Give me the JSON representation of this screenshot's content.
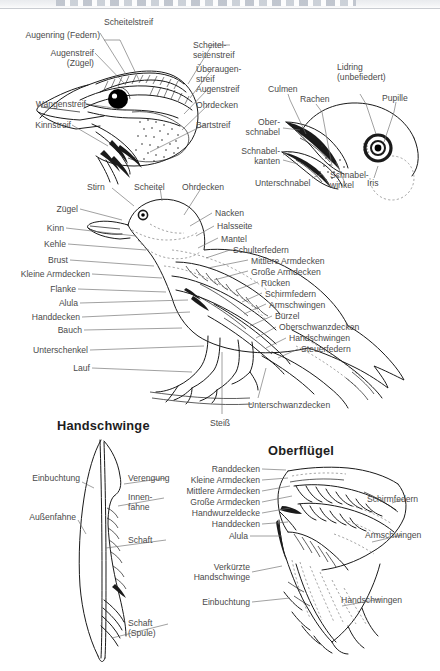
{
  "page": {
    "background_color": "#ffffff",
    "ink_color": "#1a1a1a",
    "label_color": "#4a4a4a",
    "header_remnant": ""
  },
  "figures": [
    {
      "id": "head-plumage",
      "name": "head-feather-tracts-diagram",
      "title": "",
      "labels": [
        {
          "text": "Augenring (Federn)",
          "align": "right"
        },
        {
          "text": "Augenstreif\n(Zügel)",
          "align": "right"
        },
        {
          "text": "Wangenstreif",
          "align": "right"
        },
        {
          "text": "Kinnstreif",
          "align": "right"
        },
        {
          "text": "Scheitelstreif",
          "align": "left"
        },
        {
          "text": "Scheitel-\nseitenstreif",
          "align": "left"
        },
        {
          "text": "Überaugen-\nstreif",
          "align": "left"
        },
        {
          "text": "Augenstreif",
          "align": "left"
        },
        {
          "text": "Ohrdecken",
          "align": "left"
        },
        {
          "text": "Bartstreif",
          "align": "left"
        }
      ]
    },
    {
      "id": "beak-eye",
      "name": "beak-and-eye-diagram",
      "title": "",
      "labels": [
        {
          "text": "Culmen",
          "align": "left"
        },
        {
          "text": "Rachen",
          "align": "left"
        },
        {
          "text": "Lidring\n(unbefiedert)",
          "align": "left"
        },
        {
          "text": "Pupille",
          "align": "left"
        },
        {
          "text": "Ober-\nschnabel",
          "align": "right"
        },
        {
          "text": "Schnabel-\nkanten",
          "align": "right"
        },
        {
          "text": "Unterschnabel",
          "align": "left"
        },
        {
          "text": "Schnabel-\nwinkel",
          "align": "left"
        },
        {
          "text": "Iris",
          "align": "left"
        }
      ]
    },
    {
      "id": "whole-bird",
      "name": "whole-bird-topography-diagram",
      "title": "",
      "labels_left": [
        {
          "text": "Stirn"
        },
        {
          "text": "Scheitel"
        },
        {
          "text": "Ohrdecken"
        },
        {
          "text": "Zügel"
        },
        {
          "text": "Kinn"
        },
        {
          "text": "Kehle"
        },
        {
          "text": "Brust"
        },
        {
          "text": "Kleine Armdecken"
        },
        {
          "text": "Flanke"
        },
        {
          "text": "Alula"
        },
        {
          "text": "Handdecken"
        },
        {
          "text": "Bauch"
        },
        {
          "text": "Unterschenkel"
        },
        {
          "text": "Lauf"
        }
      ],
      "labels_right": [
        {
          "text": "Nacken"
        },
        {
          "text": "Halsseite"
        },
        {
          "text": "Mantel"
        },
        {
          "text": "Schulterfedern"
        },
        {
          "text": "Mittlere Armdecken"
        },
        {
          "text": "Große Armdecken"
        },
        {
          "text": "Rücken"
        },
        {
          "text": "Schirmfedern"
        },
        {
          "text": "Armschwingen"
        },
        {
          "text": "Bürzel"
        },
        {
          "text": "Oberschwanzdecken"
        },
        {
          "text": "Handschwingen"
        },
        {
          "text": "Steuerfedern"
        }
      ],
      "labels_bottom": [
        {
          "text": "Unterschwanzdecken"
        },
        {
          "text": "Steiß"
        }
      ]
    },
    {
      "id": "primary-feather",
      "name": "primary-feather-diagram",
      "title": "Handschwinge",
      "labels": [
        {
          "text": "Einbuchtung",
          "align": "right"
        },
        {
          "text": "Außenfahne",
          "align": "right"
        },
        {
          "text": "Verengung",
          "align": "left"
        },
        {
          "text": "Innen-\nfahne",
          "align": "left"
        },
        {
          "text": "Schaft",
          "align": "left"
        },
        {
          "text": "Schaft\n(Spule)",
          "align": "left"
        }
      ]
    },
    {
      "id": "upper-wing",
      "name": "upper-wing-diagram",
      "title": "Oberflügel",
      "labels_left": [
        {
          "text": "Randdecken"
        },
        {
          "text": "Kleine Armdecken"
        },
        {
          "text": "Mittlere Armdecken"
        },
        {
          "text": "Große Armdecken"
        },
        {
          "text": "Handwurzeldecke"
        },
        {
          "text": "Handdecken"
        },
        {
          "text": "Alula"
        },
        {
          "text": "Verkürzte\nHandschwinge"
        },
        {
          "text": "Einbuchtung"
        }
      ],
      "labels_right": [
        {
          "text": "Schirmfedern"
        },
        {
          "text": "Armschwingen"
        },
        {
          "text": "Handschwingen"
        }
      ]
    }
  ]
}
